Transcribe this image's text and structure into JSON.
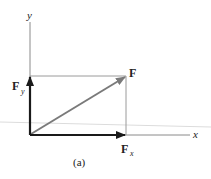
{
  "figure": {
    "caption": "(a)",
    "axes": {
      "x_label": "x",
      "y_label": "y"
    },
    "vectors": [
      {
        "id": "F",
        "label": "F",
        "subscript": "",
        "color": "#7a7a7a"
      },
      {
        "id": "Fx",
        "label": "F",
        "subscript": "x",
        "color": "#1a1a1a"
      },
      {
        "id": "Fy",
        "label": "F",
        "subscript": "y",
        "color": "#1a1a1a"
      }
    ],
    "colors": {
      "axis": "#8a8a8a",
      "construction_lines": "#9a9a9a",
      "resultant": "#7a7a7a",
      "components": "#1a1a1a",
      "stray_line": "#d8d8d8"
    }
  }
}
